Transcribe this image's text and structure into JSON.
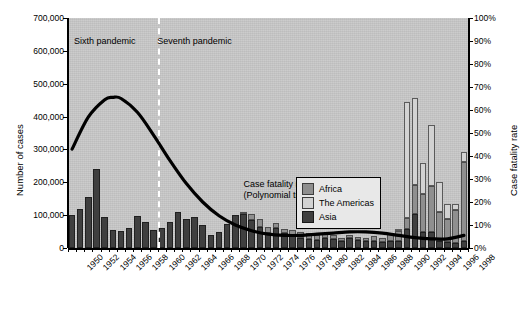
{
  "chart_data": {
    "type": "bar",
    "subtype": "stacked-bar-with-line-overlay",
    "title": "",
    "xlabel": "",
    "ylabel": "Number of cases",
    "y2label": "Case fatality rate",
    "ylim": [
      0,
      700000
    ],
    "y2lim": [
      0,
      100
    ],
    "grid": false,
    "legend_position": "inside-right",
    "x": [
      1950,
      1951,
      1952,
      1953,
      1954,
      1955,
      1956,
      1957,
      1958,
      1959,
      1960,
      1961,
      1962,
      1963,
      1964,
      1965,
      1966,
      1967,
      1968,
      1969,
      1970,
      1971,
      1972,
      1973,
      1974,
      1975,
      1976,
      1977,
      1978,
      1979,
      1980,
      1981,
      1982,
      1983,
      1984,
      1985,
      1986,
      1987,
      1988,
      1989,
      1990,
      1991,
      1992,
      1993,
      1994,
      1995,
      1996,
      1997,
      1998
    ],
    "xtick_labels": [
      "1950",
      "1952",
      "1954",
      "1956",
      "1958",
      "1960",
      "1962",
      "1964",
      "1966",
      "1968",
      "1970",
      "1972",
      "1974",
      "1976",
      "1978",
      "1980",
      "1982",
      "1984",
      "1986",
      "1988",
      "1990",
      "1992",
      "1994",
      "1996",
      "1998"
    ],
    "ytick_labels": [
      "0",
      "100,000",
      "200,000",
      "300,000",
      "400,000",
      "500,000",
      "600,000",
      "700,000"
    ],
    "ytick_values": [
      0,
      100000,
      200000,
      300000,
      400000,
      500000,
      600000,
      700000
    ],
    "y2tick_labels": [
      "0%",
      "10%",
      "20%",
      "30%",
      "40%",
      "50%",
      "60%",
      "70%",
      "80%",
      "90%",
      "100%"
    ],
    "y2tick_values": [
      0,
      10,
      20,
      30,
      40,
      50,
      60,
      70,
      80,
      90,
      100
    ],
    "series": [
      {
        "name": "Africa",
        "color": "#8f8f8f",
        "values": [
          0,
          0,
          0,
          0,
          0,
          0,
          0,
          0,
          0,
          0,
          0,
          0,
          0,
          0,
          0,
          0,
          0,
          0,
          0,
          0,
          0,
          3000,
          18000,
          22000,
          20000,
          15000,
          12000,
          14000,
          20000,
          18000,
          16000,
          13000,
          12000,
          10000,
          9000,
          10000,
          12000,
          15000,
          13000,
          22000,
          30000,
          32000,
          88000,
          115000,
          140000,
          90000,
          70000,
          100000,
          240000
        ]
      },
      {
        "name": "The Americas",
        "color": "#d2d2d2",
        "values": [
          0,
          0,
          0,
          0,
          0,
          0,
          0,
          0,
          0,
          0,
          0,
          0,
          0,
          0,
          0,
          0,
          0,
          0,
          0,
          0,
          0,
          0,
          0,
          0,
          0,
          0,
          0,
          0,
          0,
          0,
          0,
          0,
          0,
          0,
          0,
          0,
          0,
          0,
          0,
          0,
          3000,
          355000,
          265000,
          95000,
          185000,
          90000,
          45000,
          20000,
          30000
        ]
      },
      {
        "name": "Asia",
        "color": "#3f3f3f",
        "values": [
          100000,
          120000,
          155000,
          240000,
          95000,
          55000,
          52000,
          60000,
          98000,
          80000,
          55000,
          60000,
          80000,
          110000,
          88000,
          95000,
          70000,
          40000,
          48000,
          72000,
          100000,
          105000,
          85000,
          65000,
          45000,
          60000,
          45000,
          40000,
          30000,
          28000,
          25000,
          30000,
          28000,
          22000,
          30000,
          25000,
          20000,
          22000,
          18000,
          20000,
          22000,
          58000,
          105000,
          48000,
          50000,
          20000,
          18000,
          15000,
          22000
        ]
      }
    ],
    "trend": {
      "name": "Case fatality rate (Polynomial trend)",
      "color": "#000000",
      "axis": "right",
      "points": [
        {
          "x": 1950,
          "y": 43
        },
        {
          "x": 1952,
          "y": 57
        },
        {
          "x": 1954,
          "y": 64.5
        },
        {
          "x": 1955,
          "y": 65.5
        },
        {
          "x": 1956,
          "y": 65
        },
        {
          "x": 1958,
          "y": 59
        },
        {
          "x": 1960,
          "y": 49
        },
        {
          "x": 1962,
          "y": 38
        },
        {
          "x": 1964,
          "y": 28
        },
        {
          "x": 1966,
          "y": 20
        },
        {
          "x": 1968,
          "y": 14
        },
        {
          "x": 1970,
          "y": 10
        },
        {
          "x": 1972,
          "y": 7.5
        },
        {
          "x": 1974,
          "y": 6
        },
        {
          "x": 1976,
          "y": 5.5
        },
        {
          "x": 1978,
          "y": 5.5
        },
        {
          "x": 1980,
          "y": 6
        },
        {
          "x": 1982,
          "y": 6.5
        },
        {
          "x": 1984,
          "y": 7
        },
        {
          "x": 1986,
          "y": 7
        },
        {
          "x": 1988,
          "y": 6.5
        },
        {
          "x": 1990,
          "y": 5.5
        },
        {
          "x": 1992,
          "y": 4.5
        },
        {
          "x": 1994,
          "y": 4
        },
        {
          "x": 1996,
          "y": 4
        },
        {
          "x": 1998,
          "y": 5.5
        }
      ]
    },
    "annotations": [
      {
        "name": "sixth-pandemic",
        "text": "Sixth pandemic",
        "x": 1953.5,
        "y_pct": 92
      },
      {
        "name": "seventh-pandemic",
        "text": "Seventh pandemic",
        "x": 1964.5,
        "y_pct": 92
      },
      {
        "name": "case-fatality-note",
        "text": "Case fatality rate\n(Polynomial trend)",
        "x": 1971,
        "y_pct": 30
      }
    ],
    "divider": {
      "name": "pandemic-divider",
      "x": 1960.5,
      "style": "dashed",
      "color": "#ffffff"
    }
  },
  "axes": {
    "left": {
      "title": "Number of cases",
      "ticks": [
        "700,000",
        "600,000",
        "500,000",
        "400,000",
        "300,000",
        "200,000",
        "100,000",
        "0"
      ]
    },
    "right": {
      "title": "Case fatality rate",
      "ticks": [
        "100%",
        "90%",
        "80%",
        "70%",
        "60%",
        "50%",
        "40%",
        "30%",
        "20%",
        "10%",
        "0%"
      ]
    },
    "bottom": {
      "ticks": [
        "1950",
        "1952",
        "1954",
        "1956",
        "1958",
        "1960",
        "1962",
        "1964",
        "1966",
        "1968",
        "1970",
        "1972",
        "1974",
        "1976",
        "1978",
        "1980",
        "1982",
        "1984",
        "1986",
        "1988",
        "1990",
        "1992",
        "1994",
        "1996",
        "1998"
      ]
    }
  },
  "annotations": {
    "sixth_pandemic": "Sixth pandemic",
    "seventh_pandemic": "Seventh pandemic",
    "case_fatality_line1": "Case fatality rate",
    "case_fatality_line2": "(Polynomial trend)"
  },
  "legend": {
    "items": [
      {
        "label": "Africa",
        "color": "#8f8f8f"
      },
      {
        "label": "The Americas",
        "color": "#d2d2d2"
      },
      {
        "label": "Asia",
        "color": "#3f3f3f"
      }
    ]
  },
  "colors": {
    "plot_background": "#c9c9c9",
    "africa": "#8f8f8f",
    "americas": "#d2d2d2",
    "asia": "#3f3f3f",
    "trend_line": "#000000",
    "divider": "#ffffff"
  }
}
